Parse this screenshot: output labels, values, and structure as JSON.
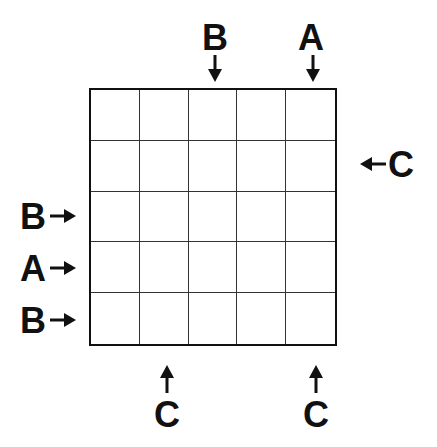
{
  "puzzle": {
    "grid_size": 5,
    "clues": {
      "top": [
        "",
        "",
        "B",
        "",
        "A"
      ],
      "bottom": [
        "",
        "C",
        "",
        "",
        "C"
      ],
      "left": [
        "",
        "",
        "B",
        "A",
        "B"
      ],
      "right": [
        "",
        "C",
        "",
        "",
        ""
      ]
    },
    "arrow_icon": "arrow-icon"
  }
}
